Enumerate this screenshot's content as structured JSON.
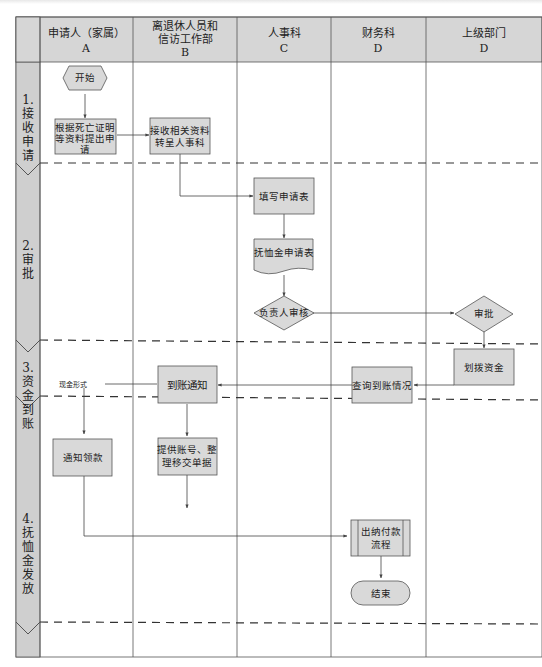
{
  "diagram": {
    "type": "swimlane-flowchart",
    "colors": {
      "shape_fill": "#d9d9d9",
      "header_fill": "#d6d6d6",
      "phase_fill": "#cfcfcf",
      "line": "#555555"
    },
    "lanes": [
      {
        "id": "A",
        "title": "申请人（家属）",
        "code": "A"
      },
      {
        "id": "B",
        "title_line1": "离退休人员和",
        "title_line2": "信访工作部",
        "code": "B"
      },
      {
        "id": "C",
        "title": "人事科",
        "code": "C"
      },
      {
        "id": "D1",
        "title": "财务科",
        "code": "D"
      },
      {
        "id": "D2",
        "title": "上级部门",
        "code": "D"
      }
    ],
    "phases": [
      {
        "num": "1.",
        "chars": [
          "接",
          "收",
          "申",
          "请"
        ]
      },
      {
        "num": "2.",
        "chars": [
          "审",
          "批"
        ]
      },
      {
        "num": "3.",
        "chars": [
          "资",
          "金",
          "到",
          "账"
        ]
      },
      {
        "num": "4.",
        "chars": [
          "抚",
          "恤",
          "金",
          "发",
          "放"
        ]
      }
    ],
    "nodes": {
      "start": "开始",
      "submit_l1": "根据死亡证明",
      "submit_l2": "等资料提出申",
      "submit_l3": "请",
      "receive_l1": "接收相关资料",
      "receive_l2": "转呈人事科",
      "fill_form": "填写申请表",
      "form_doc": "抚恤金申请表",
      "head_review": "负责人审核",
      "approve": "审批",
      "allocate": "划拨资金",
      "check_arrival": "查询到账情况",
      "arrival_notice": "到账通知",
      "notify_collect": "通知领款",
      "provide_l1": "提供账号、整",
      "provide_l2": "理移交单据",
      "cashier_l1": "出纳付款",
      "cashier_l2": "流程",
      "end": "结束"
    },
    "edge_labels": {
      "cash": "现金形式",
      "transfer": "转账形式"
    }
  }
}
